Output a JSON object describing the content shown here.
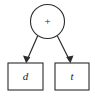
{
  "diagram": {
    "type": "expression-tree",
    "canvas": {
      "width": 95,
      "height": 98,
      "background": "#ffffff"
    },
    "colors": {
      "stroke": "#2b2b2b",
      "fill": "#ffffff",
      "text": "#1a1a1a"
    },
    "root": {
      "shape": "circle",
      "label": "+",
      "cx": 47.5,
      "cy": 21.5,
      "r": 17
    },
    "leaves": [
      {
        "shape": "rectangle",
        "label": "d",
        "x": 8,
        "y": 63,
        "width": 35,
        "height": 27,
        "cx": 25.5,
        "cy": 76.5
      },
      {
        "shape": "rectangle",
        "label": "t",
        "x": 55,
        "y": 63,
        "width": 34,
        "height": 27,
        "cx": 72,
        "cy": 76.5
      }
    ],
    "edges": [
      {
        "from": "root",
        "to": "d",
        "x1": 37.6,
        "y1": 36.0,
        "x2": 26.2,
        "y2": 62.0
      },
      {
        "from": "root",
        "to": "t",
        "x1": 57.4,
        "y1": 36.0,
        "x2": 70.4,
        "y2": 62.0
      }
    ]
  }
}
